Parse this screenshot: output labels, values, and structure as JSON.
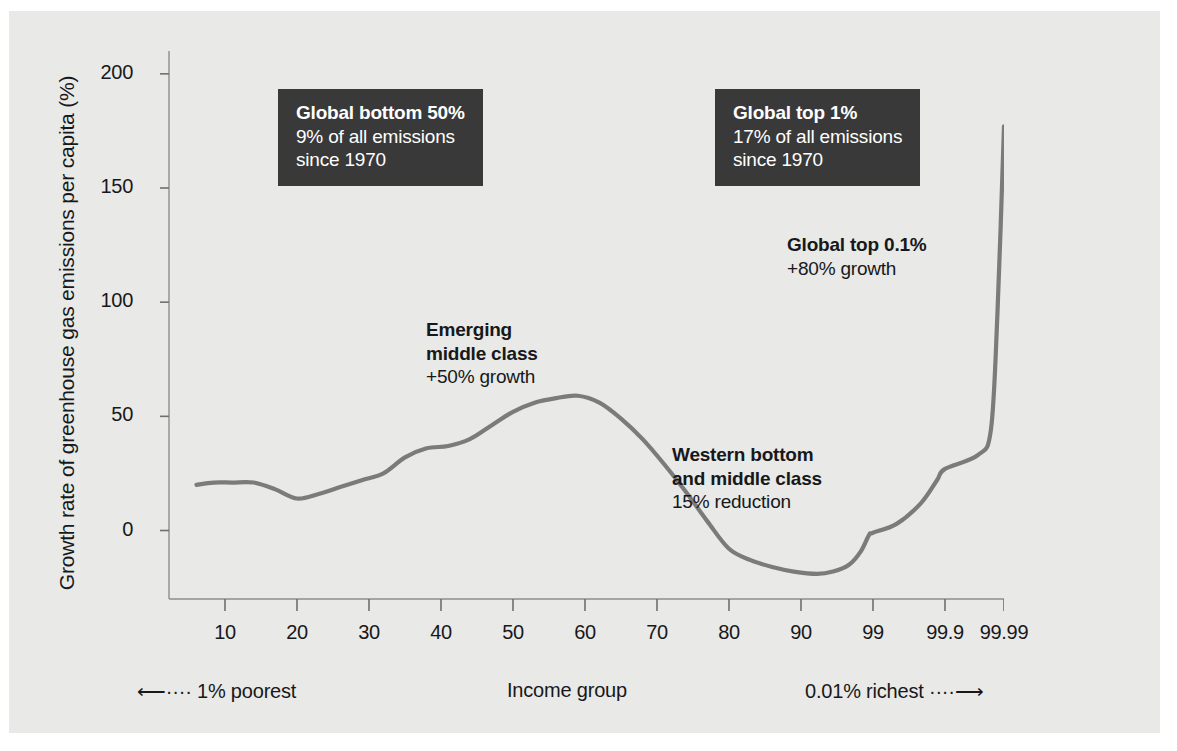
{
  "chart_data": {
    "type": "line",
    "title": "",
    "xlabel": "Income group",
    "ylabel": "Growth rate of greenhouse gas emissions per capita (%)",
    "ylim": [
      -30,
      210
    ],
    "yticks": [
      0,
      50,
      100,
      150,
      200
    ],
    "ytick_labels": [
      "0",
      "50",
      "100",
      "150",
      "200"
    ],
    "xticks": [
      10,
      20,
      30,
      40,
      50,
      60,
      70,
      80,
      90,
      99,
      99.9,
      99.99
    ],
    "xtick_labels": [
      "10",
      "20",
      "30",
      "40",
      "50",
      "60",
      "70",
      "80",
      "90",
      "99",
      "99.9",
      "99.99"
    ],
    "x_scale": "percentile (compressed at top)",
    "grid": false,
    "legend": null,
    "series": [
      {
        "name": "Growth rate of greenhouse gas emissions per capita",
        "x": [
          5,
          8,
          11,
          14,
          17,
          20,
          23,
          26,
          29,
          32,
          35,
          38,
          41,
          44,
          47,
          50,
          53,
          56,
          59,
          62,
          65,
          68,
          71,
          74,
          77,
          80,
          83,
          86,
          89,
          92,
          94,
          96,
          97.5,
          98.5,
          99,
          99.3,
          99.6,
          99.8,
          99.9,
          99.95,
          99.97,
          99.98,
          99.99
        ],
        "y": [
          20,
          21,
          21,
          21,
          18,
          14,
          16,
          19,
          22,
          25,
          32,
          36,
          37,
          40,
          46,
          52,
          56,
          58,
          59,
          56,
          49,
          40,
          29,
          17,
          4,
          -8,
          -13,
          -16,
          -18,
          -19,
          -18,
          -15,
          -9,
          -2,
          -1,
          3,
          12,
          22,
          27,
          33,
          44,
          95,
          177
        ]
      }
    ],
    "annotations": [
      {
        "id": "global-bottom-50",
        "style": "dark-box",
        "heading": "Global bottom 50%",
        "lines": [
          "9% of all emissions",
          "since 1970"
        ]
      },
      {
        "id": "global-top-1",
        "style": "dark-box",
        "heading": "Global top 1%",
        "lines": [
          "17% of all emissions",
          "since 1970"
        ]
      },
      {
        "id": "emerging-middle-class",
        "style": "plain",
        "heading_lines": [
          "Emerging",
          "middle class"
        ],
        "lines": [
          "+50% growth"
        ]
      },
      {
        "id": "western-bottom-and-middle-class",
        "style": "plain",
        "heading_lines": [
          "Western bottom",
          "and middle class"
        ],
        "lines": [
          "15% reduction"
        ]
      },
      {
        "id": "global-top-0.1",
        "style": "plain",
        "heading_lines": [
          "Global top 0.1%"
        ],
        "lines": [
          "+80% growth"
        ]
      }
    ],
    "axis_captions": {
      "left": "1% poorest",
      "center": "Income group",
      "right": "0.01% richest",
      "left_arrow": "⟵····",
      "right_arrow": "····⟶"
    },
    "colors": {
      "background": "#e9e9e7",
      "line": "#7b7b7b",
      "axis": "#6f6f6f",
      "text": "#17181a",
      "callout_bg": "#393939",
      "callout_text": "#ffffff"
    }
  },
  "callouts": {
    "bottom50": {
      "heading": "Global bottom 50%",
      "line1": "9% of all emissions",
      "line2": "since 1970"
    },
    "top1": {
      "heading": "Global top 1%",
      "line1": "17% of all emissions",
      "line2": "since 1970"
    }
  },
  "annotations": {
    "emerging": {
      "heading1": "Emerging",
      "heading2": "middle class",
      "line1": "+50% growth"
    },
    "western": {
      "heading1": "Western bottom",
      "heading2": "and middle class",
      "line1": "15% reduction"
    },
    "top01": {
      "heading1": "Global top 0.1%",
      "line1": "+80% growth"
    }
  },
  "axis": {
    "y_title": "Growth rate of greenhouse gas emissions per capita (%)",
    "caption_left": "⟵···· 1% poorest",
    "caption_center": "Income group",
    "caption_right": "0.01% richest ····⟶"
  }
}
